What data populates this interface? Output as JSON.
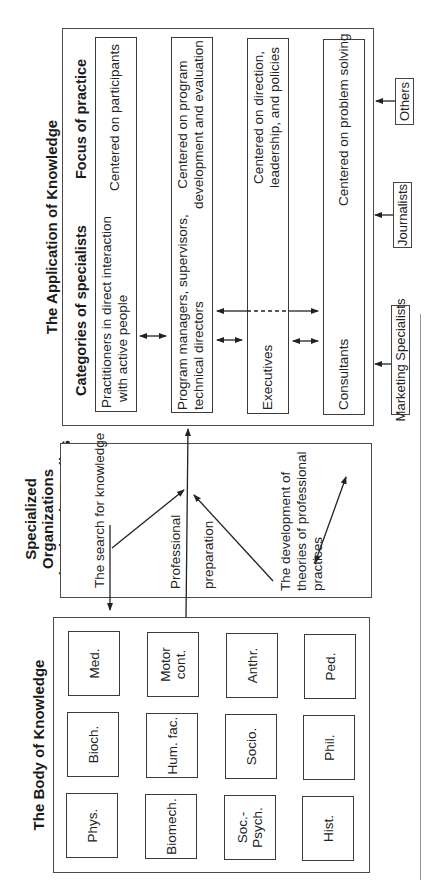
{
  "body_of_knowledge": {
    "title": "The Body of Knowledge",
    "disciplines": [
      [
        "Phys.",
        "Bioch.",
        "Med."
      ],
      [
        "Biomech.",
        "Hum. fac.",
        "Motor cont."
      ],
      [
        "Soc.-Psych.",
        "Socio.",
        "Anthr."
      ],
      [
        "Hist.",
        "Phil.",
        "Ped."
      ]
    ]
  },
  "specialized_bodies": {
    "title_line1": "Specialized Organizations",
    "title_line2": "and University Bodies",
    "search_label": "The search for knowledge",
    "prep_label_1": "Professional",
    "prep_label_2": "preparation",
    "theory_line1": "The development of",
    "theory_line2": "theories of professional",
    "theory_line3": "practices"
  },
  "application": {
    "title": "The Application of Knowledge",
    "col_categories": "Categories of specialists",
    "col_focus": "Focus of practice",
    "rows": [
      {
        "category": [
          "Practitioners in direct interaction",
          "with active people"
        ],
        "focus": [
          "Centered on participants"
        ]
      },
      {
        "category": [
          "Program managers, supervisors,",
          "technical directors"
        ],
        "focus": [
          "Centered on program",
          "development and evaluation"
        ]
      },
      {
        "category": [
          "Executives"
        ],
        "focus": [
          "Centered on direction,",
          "leadership, and policies"
        ]
      },
      {
        "category": [
          "Consultants"
        ],
        "focus": [
          "Centered on problem solving"
        ]
      }
    ],
    "external": [
      "Marketing Specialists",
      "Journalists",
      "Others"
    ]
  },
  "colors": {
    "line": "#2a2a2a",
    "box_border": "#3a3a3a",
    "background": "#ffffff"
  }
}
